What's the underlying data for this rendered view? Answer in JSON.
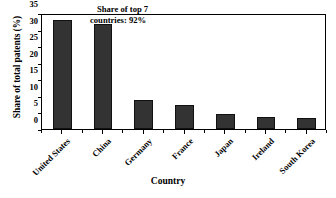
{
  "chart_data": {
    "type": "bar",
    "title": "",
    "subtitle": "",
    "xlabel": "Country",
    "ylabel": "Share of total patents (%)",
    "categories": [
      "United States",
      "China",
      "Germany",
      "France",
      "Japan",
      "Ireland",
      "South Korea"
    ],
    "values": [
      33.0,
      31.7,
      8.8,
      7.3,
      4.5,
      3.7,
      3.2
    ],
    "ylim": [
      0,
      35
    ],
    "yticks": [
      0,
      5,
      10,
      15,
      20,
      25,
      30,
      35
    ],
    "ytick_labels": [
      "0",
      "5",
      "10",
      "15",
      "20",
      "25",
      "30",
      "35"
    ],
    "grid": false,
    "legend": "none",
    "annotations": [
      {
        "name": "share-of-top-7-note",
        "line1": "Share of top 7",
        "line2": "countries: 92%",
        "text": "Share of top 7 countries: 92%"
      }
    ],
    "colors": {
      "bar_fill": "#333333",
      "bar_edge": "#111111",
      "axis": "#000000",
      "background": "#ffffff"
    }
  }
}
